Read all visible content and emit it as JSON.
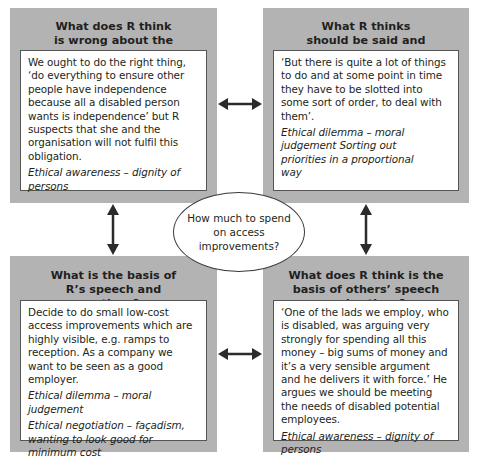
{
  "diagram": {
    "center": {
      "text": "How much to spend on access improvements?"
    },
    "quadrants": {
      "top_left": {
        "title": "What does R think is wrong about the issue?",
        "body": "We ought to do the right thing, ‘do everything to ensure other people have independence because all a disabled person wants is independence’ but R suspects that she and the organisation will not fulfil this obligation.",
        "notes": [
          "Ethical awareness – dignity of persons"
        ]
      },
      "top_right": {
        "title": "What R thinks should be said and done",
        "body": "‘But there is quite a lot of things to do and at some point in time they have to be slotted into some sort of order, to deal with them’.",
        "notes": [
          "Ethical dilemma – moral judgement Sorting out priorities in a proportional way"
        ]
      },
      "bottom_left": {
        "title": "What is the basis of R’s speech and actions?",
        "body": "Decide to do small low-cost access improvements which are highly visible, e.g. ramps to reception. As a company we want to be seen as a good employer.",
        "notes": [
          "Ethical dilemma – moral judgement",
          "Ethical negotiation – façadism, wanting to look good for minimum cost"
        ]
      },
      "bottom_right": {
        "title": "What does R think is the basis of others’ speech and actions?",
        "body": "‘One of the lads we employ, who is disabled, was arguing very strongly for spending all this money – big sums of money and it’s a very sensible argument and he delivers it with force.’ He argues we should be meeting the needs of disabled potential employees.",
        "notes": [
          "Ethical awareness – dignity of persons"
        ]
      }
    },
    "connectors": [
      {
        "from": "top_left",
        "to": "top_right",
        "type": "double-arrow"
      },
      {
        "from": "bottom_left",
        "to": "bottom_right",
        "type": "double-arrow"
      },
      {
        "from": "top_left",
        "to": "bottom_left",
        "type": "double-arrow"
      },
      {
        "from": "top_right",
        "to": "bottom_right",
        "type": "double-arrow"
      }
    ],
    "colors": {
      "box_fill": "#b3b3b3",
      "inner_fill": "#ffffff",
      "arrow": "#2b2b2b",
      "text": "#231f20"
    }
  }
}
